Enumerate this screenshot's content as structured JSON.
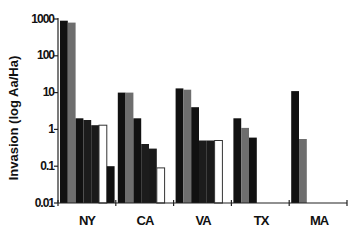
{
  "chart_data": {
    "type": "bar",
    "title": "",
    "xlabel": "",
    "ylabel": "Invasion (log  Aa/Ha)",
    "yscale": "log",
    "ylim": [
      0.01,
      1000
    ],
    "yticks": [
      "1000",
      "100",
      "10",
      "1",
      "0.1",
      "0.01"
    ],
    "grid": false,
    "legend": null,
    "categories": [
      "NY",
      "CA",
      "VA",
      "TX",
      "MA"
    ],
    "groups": [
      {
        "name": "NY",
        "bars": [
          {
            "fill": "#111111",
            "value": 900
          },
          {
            "fill": "#6e6e6e",
            "value": 800
          },
          {
            "fill": "#111111",
            "value": 2
          },
          {
            "fill": "#1c1c1c",
            "value": 1.8
          },
          {
            "fill": "#1a1a1a",
            "value": 1.3
          },
          {
            "fill": "#ffffff",
            "value": 1.3
          },
          {
            "fill": "#111111",
            "value": 0.1
          }
        ]
      },
      {
        "name": "CA",
        "bars": [
          {
            "fill": "#111111",
            "value": 10
          },
          {
            "fill": "#6e6e6e",
            "value": 10
          },
          {
            "fill": "#111111",
            "value": 2
          },
          {
            "fill": "#1c1c1c",
            "value": 0.4
          },
          {
            "fill": "#1a1a1a",
            "value": 0.3
          },
          {
            "fill": "#ffffff",
            "value": 0.09
          }
        ]
      },
      {
        "name": "VA",
        "bars": [
          {
            "fill": "#111111",
            "value": 13
          },
          {
            "fill": "#6e6e6e",
            "value": 12
          },
          {
            "fill": "#111111",
            "value": 4
          },
          {
            "fill": "#1c1c1c",
            "value": 0.5
          },
          {
            "fill": "#1a1a1a",
            "value": 0.5
          },
          {
            "fill": "#ffffff",
            "value": 0.5
          }
        ]
      },
      {
        "name": "TX",
        "bars": [
          {
            "fill": "#111111",
            "value": 2
          },
          {
            "fill": "#6e6e6e",
            "value": 1.1
          },
          {
            "fill": "#111111",
            "value": 0.6
          }
        ]
      },
      {
        "name": "MA",
        "bars": [
          {
            "fill": "#111111",
            "value": 11
          },
          {
            "fill": "#6e6e6e",
            "value": 0.55
          }
        ]
      }
    ]
  }
}
